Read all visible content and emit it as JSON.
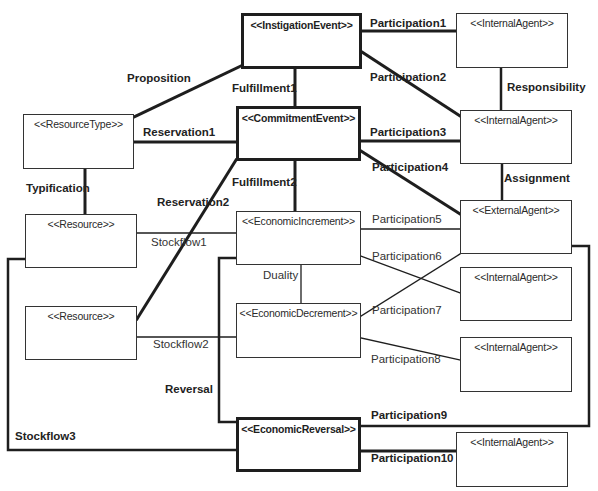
{
  "diagram": {
    "boxes": [
      {
        "id": "instigation_event",
        "label": "<<InstigationEvent>>",
        "x": 241,
        "y": 13,
        "w": 121,
        "h": 56,
        "thick": true
      },
      {
        "id": "internal_agent_1",
        "label": "<<InternalAgent>>",
        "x": 456,
        "y": 13,
        "w": 112,
        "h": 55,
        "thick": false
      },
      {
        "id": "resource_type",
        "label": "<<ResourceType>>",
        "x": 23,
        "y": 114,
        "w": 111,
        "h": 55,
        "thick": false
      },
      {
        "id": "commitment_event",
        "label": "<<CommitmentEvent>>",
        "x": 236,
        "y": 106,
        "w": 125,
        "h": 55,
        "thick": true
      },
      {
        "id": "internal_agent_2",
        "label": "<<InternalAgent>>",
        "x": 460,
        "y": 110,
        "w": 112,
        "h": 54,
        "thick": false
      },
      {
        "id": "resource_1",
        "label": "<<Resource>>",
        "x": 25,
        "y": 214,
        "w": 112,
        "h": 54,
        "thick": false
      },
      {
        "id": "economic_increment",
        "label": "<<EconomicIncrement>>",
        "x": 236,
        "y": 211,
        "w": 125,
        "h": 54,
        "thick": false
      },
      {
        "id": "external_agent",
        "label": "<<ExternalAgent>>",
        "x": 460,
        "y": 200,
        "w": 112,
        "h": 54,
        "thick": false
      },
      {
        "id": "internal_agent_3",
        "label": "<<InternalAgent>>",
        "x": 460,
        "y": 267,
        "w": 112,
        "h": 54,
        "thick": false
      },
      {
        "id": "resource_2",
        "label": "<<Resource>>",
        "x": 25,
        "y": 306,
        "w": 112,
        "h": 54,
        "thick": false
      },
      {
        "id": "economic_decrement",
        "label": "<<EconomicDecrement>>",
        "x": 236,
        "y": 303,
        "w": 125,
        "h": 55,
        "thick": false
      },
      {
        "id": "internal_agent_4",
        "label": "<<InternalAgent>>",
        "x": 460,
        "y": 337,
        "w": 112,
        "h": 55,
        "thick": false
      },
      {
        "id": "economic_reversal",
        "label": "<<EconomicReversal>>",
        "x": 236,
        "y": 417,
        "w": 125,
        "h": 55,
        "thick": true
      },
      {
        "id": "internal_agent_5",
        "label": "<<InternalAgent>>",
        "x": 456,
        "y": 432,
        "w": 112,
        "h": 55,
        "thick": false
      }
    ],
    "associations": [
      {
        "id": "participation1",
        "label": "Participation1",
        "bold": true,
        "lx": 370,
        "ly": 17,
        "points": [
          [
            362,
            31
          ],
          [
            456,
            31
          ]
        ],
        "width": 3
      },
      {
        "id": "participation2",
        "label": "Participation2",
        "bold": true,
        "lx": 370,
        "ly": 71,
        "points": [
          [
            362,
            52
          ],
          [
            460,
            116
          ]
        ],
        "width": 3
      },
      {
        "id": "proposition",
        "label": "Proposition",
        "bold": true,
        "lx": 127,
        "ly": 72,
        "points": [
          [
            241,
            66
          ],
          [
            134,
            117
          ]
        ],
        "width": 3
      },
      {
        "id": "fulfillment1",
        "label": "Fulfillment1",
        "bold": true,
        "lx": 232,
        "ly": 82,
        "points": [
          [
            295,
            69
          ],
          [
            295,
            106
          ]
        ],
        "width": 3
      },
      {
        "id": "responsibility",
        "label": "Responsibility",
        "bold": true,
        "lx": 507,
        "ly": 81,
        "points": [
          [
            501,
            69
          ],
          [
            501,
            110
          ]
        ],
        "width": 2.5
      },
      {
        "id": "reservation1",
        "label": "Reservation1",
        "bold": true,
        "lx": 143,
        "ly": 126,
        "points": [
          [
            134,
            142
          ],
          [
            236,
            142
          ]
        ],
        "width": 3
      },
      {
        "id": "participation3",
        "label": "Participation3",
        "bold": true,
        "lx": 370,
        "ly": 126,
        "points": [
          [
            361,
            141
          ],
          [
            460,
            141
          ]
        ],
        "width": 3
      },
      {
        "id": "participation4",
        "label": "Participation4",
        "bold": true,
        "lx": 372,
        "ly": 161,
        "points": [
          [
            361,
            151
          ],
          [
            460,
            214
          ]
        ],
        "width": 3
      },
      {
        "id": "assignment",
        "label": "Assignment",
        "bold": true,
        "lx": 504,
        "ly": 172,
        "points": [
          [
            502,
            164
          ],
          [
            502,
            200
          ]
        ],
        "width": 2.5
      },
      {
        "id": "typification",
        "label": "Typification",
        "bold": true,
        "lx": 26,
        "ly": 182,
        "points": [
          [
            85,
            169
          ],
          [
            85,
            214
          ]
        ],
        "width": 3
      },
      {
        "id": "fulfillment2",
        "label": "Fulfillment2",
        "bold": true,
        "lx": 232,
        "ly": 176,
        "points": [
          [
            295,
            161
          ],
          [
            295,
            211
          ]
        ],
        "width": 3
      },
      {
        "id": "reservation2",
        "label": "Reservation2",
        "bold": true,
        "lx": 157,
        "ly": 196,
        "points": [
          [
            236,
            160
          ],
          [
            137,
            319
          ]
        ],
        "width": 3
      },
      {
        "id": "stockflow1",
        "label": "Stockflow1",
        "bold": false,
        "lx": 151,
        "ly": 236,
        "points": [
          [
            137,
            233
          ],
          [
            236,
            233
          ]
        ],
        "width": 1.3
      },
      {
        "id": "participation5",
        "label": "Participation5",
        "bold": false,
        "lx": 372,
        "ly": 213,
        "points": [
          [
            361,
            229
          ],
          [
            460,
            229
          ]
        ],
        "width": 1.3
      },
      {
        "id": "participation6",
        "label": "Participation6",
        "bold": false,
        "lx": 372,
        "ly": 250,
        "points": [
          [
            361,
            256
          ],
          [
            460,
            293
          ]
        ],
        "width": 1.3
      },
      {
        "id": "duality",
        "label": "Duality",
        "bold": false,
        "lx": 263,
        "ly": 269,
        "points": [
          [
            301,
            265
          ],
          [
            301,
            303
          ]
        ],
        "width": 1.3
      },
      {
        "id": "participation7",
        "label": "Participation7",
        "bold": false,
        "lx": 372,
        "ly": 304,
        "points": [
          [
            361,
            316
          ],
          [
            460,
            254
          ]
        ],
        "width": 1.3
      },
      {
        "id": "stockflow2",
        "label": "Stockflow2",
        "bold": false,
        "lx": 153,
        "ly": 338,
        "points": [
          [
            137,
            337
          ],
          [
            236,
            337
          ]
        ],
        "width": 1.3
      },
      {
        "id": "participation8",
        "label": "Participation8",
        "bold": false,
        "lx": 371,
        "ly": 353,
        "points": [
          [
            361,
            338
          ],
          [
            460,
            360
          ]
        ],
        "width": 1.3
      },
      {
        "id": "reversal",
        "label": "Reversal",
        "bold": true,
        "lx": 165,
        "ly": 383,
        "points": [
          [
            236,
            258
          ],
          [
            219,
            258
          ],
          [
            219,
            422
          ],
          [
            236,
            422
          ]
        ],
        "width": 2.5
      },
      {
        "id": "participation9",
        "label": "Participation9",
        "bold": true,
        "lx": 371,
        "ly": 409,
        "points": [
          [
            361,
            426
          ],
          [
            589,
            426
          ],
          [
            589,
            246
          ],
          [
            572,
            246
          ]
        ],
        "width": 2.5
      },
      {
        "id": "stockflow3",
        "label": "Stockflow3",
        "bold": true,
        "lx": 15,
        "ly": 430,
        "points": [
          [
            25,
            259
          ],
          [
            8,
            259
          ],
          [
            8,
            450
          ],
          [
            236,
            450
          ]
        ],
        "width": 2.5
      },
      {
        "id": "participation10",
        "label": "Participation10",
        "bold": true,
        "lx": 371,
        "ly": 452,
        "points": [
          [
            361,
            451
          ],
          [
            456,
            451
          ]
        ],
        "width": 3
      }
    ]
  }
}
